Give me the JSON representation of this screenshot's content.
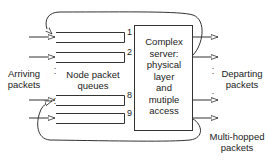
{
  "diagram": {
    "type": "queueing-network",
    "labels": {
      "arriving": [
        "Arriving",
        "packets"
      ],
      "queues": [
        "Node packet",
        "queues"
      ],
      "departing": [
        "Departing",
        "packets"
      ],
      "multihop": [
        "Multi-hopped",
        "packets"
      ]
    },
    "server": {
      "lines": [
        "Complex",
        "server:",
        "physical",
        "layer",
        "and",
        "mutiple",
        "access"
      ]
    },
    "queue_numbers": [
      "1",
      "2",
      "8",
      "9"
    ],
    "colors": {
      "stroke": "#333333",
      "text": "#222222",
      "background": "#ffffff"
    }
  }
}
